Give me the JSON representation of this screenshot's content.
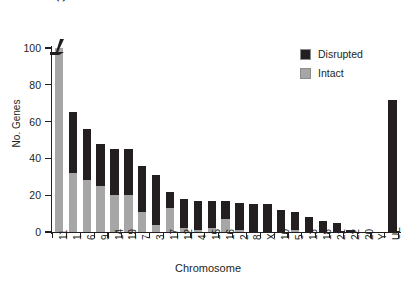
{
  "chart": {
    "title": "",
    "y_axis_title": "No. Genes",
    "x_axis_title": "Chromosome",
    "break_annotation": "361",
    "y_ticks": [
      "0",
      "20",
      "40",
      "60",
      "80",
      "100"
    ],
    "legend": {
      "disrupted_label": "Disrupted",
      "intact_label": "Intact",
      "disrupted_color": "#231f20",
      "intact_color": "#a6a6a6"
    }
  },
  "chart_data": {
    "type": "bar",
    "subtype": "stacked-vertical",
    "title": "",
    "xlabel": "Chromosome",
    "ylabel": "No. Genes",
    "ylim": [
      0,
      100
    ],
    "yticks": [
      0,
      20,
      40,
      60,
      80,
      100
    ],
    "grid": false,
    "legend_position": "upper-right",
    "axis_break": {
      "category": "11",
      "displayed_total": 361,
      "note": "bar for chromosome 11 is truncated at the axis break; true total is 361"
    },
    "categories": [
      "11",
      "1",
      "6",
      "9",
      "14",
      "19",
      "7",
      "3",
      "17",
      "12",
      "4",
      "15",
      "16",
      "2",
      "8",
      "X",
      "10",
      "5",
      "13",
      "18",
      "21",
      "22",
      "20",
      "Y",
      "UL"
    ],
    "series": [
      {
        "name": "Intact",
        "color": "#a6a6a6",
        "values": [
          100,
          32,
          28,
          25,
          20,
          20,
          11,
          4,
          13,
          2,
          1,
          2,
          7,
          1,
          0,
          0,
          0,
          1,
          0,
          0,
          0,
          0,
          0,
          0,
          0
        ]
      },
      {
        "name": "Disrupted",
        "color": "#231f20",
        "values": [
          0,
          33,
          28,
          23,
          25,
          25,
          25,
          27,
          9,
          16,
          16,
          15,
          10,
          15,
          15,
          15,
          12,
          10,
          8,
          6,
          5,
          1,
          0,
          0,
          72
        ]
      }
    ],
    "totals": [
      361,
      65,
      56,
      48,
      45,
      45,
      36,
      31,
      22,
      18,
      17,
      17,
      17,
      16,
      15,
      15,
      12,
      11,
      8,
      6,
      5,
      1,
      0,
      0,
      72
    ]
  }
}
